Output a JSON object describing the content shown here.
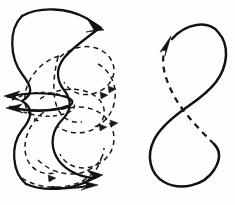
{
  "image": {
    "title": "Two motion-path line diagrams",
    "background_color": "#fefefe",
    "ink_color": "#111111",
    "width": 235,
    "height": 205,
    "style": "vintage engraving line art"
  },
  "figures": [
    {
      "id": "left-figure",
      "name": "tangled-loop-diagram",
      "description": "Dense interlaced figure of solid wavy outlines and dashed interior loops with directional arrowheads",
      "solid_curve_count": 4,
      "dashed_curve_count": 9,
      "arrowheads": [
        {
          "name": "top-right-arrow",
          "x": 101,
          "y": 27,
          "angle": 35,
          "size": 11,
          "style": "solid"
        },
        {
          "name": "mid-left-arrow",
          "x": 7,
          "y": 97,
          "angle": 196,
          "size": 10,
          "style": "solid"
        },
        {
          "name": "mid-left-lower-arrow",
          "x": 9,
          "y": 107,
          "angle": 186,
          "size": 9,
          "style": "solid"
        },
        {
          "name": "bottom-right-arrow",
          "x": 99,
          "y": 176,
          "angle": 8,
          "size": 11,
          "style": "solid"
        },
        {
          "name": "bottom-right-lower-arrow",
          "x": 94,
          "y": 184,
          "angle": 352,
          "size": 9,
          "style": "solid"
        }
      ]
    },
    {
      "id": "right-figure",
      "name": "figure-eight-diagram",
      "description": "Lemniscate loop: solid stroke for outer path, dashed stroke for the return diagonal, arrowhead at upper left",
      "solid_curve_count": 1,
      "dashed_curve_count": 1,
      "crossing_point": {
        "x": 183,
        "y": 110
      },
      "arrowheads": [
        {
          "name": "upper-left-arrow",
          "x": 170,
          "y": 40,
          "angle": 300,
          "size": 13,
          "style": "solid"
        }
      ]
    }
  ],
  "strokes": {
    "solid_width": 2.1,
    "dashed_width": 1.5,
    "dash_pattern": "5,4",
    "dash_pattern_fine": "4,3.5"
  }
}
